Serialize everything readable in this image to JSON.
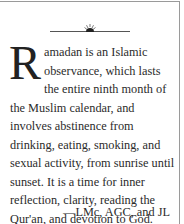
{
  "ornament": {
    "icon": "half-sun-ornament"
  },
  "paragraph": {
    "drop_cap": "R",
    "body": "amadan is an Islamic observance, which lasts the entire ninth month of the Muslim calendar, and involves abstinence from drinking, eating, smoking, and sexual activity, from sunrise until sunset. It is a time for inner reflection, clarity, reading the Qur'an, and devotion to God."
  },
  "attribution": "—LMc, AGC, and JL",
  "colors": {
    "border": "#9a9a9a",
    "text": "#2b2b2b"
  }
}
